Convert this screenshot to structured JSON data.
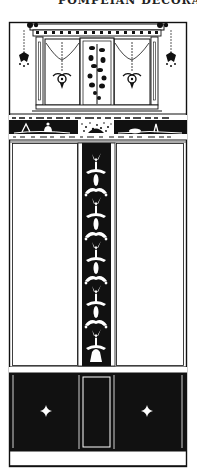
{
  "page": {
    "header_text_partial": "POMPEIAN  DECORATION  203"
  },
  "illustration": {
    "colors": {
      "ink": "#111111",
      "paper": "#ffffff"
    },
    "sections": [
      {
        "name": "upper-zone",
        "content": "aedicula window with garlands and central vine panel"
      },
      {
        "name": "frieze",
        "content": "dark band with figures and objects"
      },
      {
        "name": "middle-zone",
        "content": "two white panels flanking dark pilaster with foliate candelabrum"
      },
      {
        "name": "dado",
        "content": "dark base band with two cross-rosettes and central framed panel"
      }
    ]
  }
}
